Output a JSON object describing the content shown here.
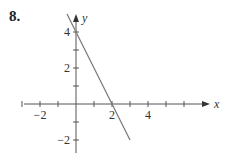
{
  "problem": {
    "number": "8."
  },
  "chart_data": {
    "type": "line",
    "title": "",
    "xlabel": "x",
    "ylabel": "y",
    "xlim": [
      -3,
      7
    ],
    "ylim": [
      -2.5,
      5
    ],
    "grid": false,
    "x_ticks": [
      -3,
      -2,
      -1,
      1,
      2,
      3,
      4,
      5,
      6
    ],
    "y_ticks": [
      -2,
      -1,
      1,
      2,
      3,
      4
    ],
    "x_tick_labels": [
      {
        "value": -2,
        "label": "−2"
      },
      {
        "value": 2,
        "label": "2"
      },
      {
        "value": 4,
        "label": "4"
      }
    ],
    "y_tick_labels": [
      {
        "value": 4,
        "label": "4"
      },
      {
        "value": 2,
        "label": "2"
      },
      {
        "value": -2,
        "label": "−2"
      }
    ],
    "series": [
      {
        "name": "line",
        "equation": "y = -2x + 4",
        "x": [
          -0.5,
          3
        ],
        "y": [
          5,
          -2
        ],
        "color": "#777777"
      }
    ],
    "intercepts": {
      "x_intercept": 2,
      "y_intercept": 4
    }
  },
  "layout": {
    "origin_px": [
      76,
      104
    ],
    "unit_px": 18,
    "axis_color": "#555555",
    "line_color": "#7a7a7a"
  }
}
